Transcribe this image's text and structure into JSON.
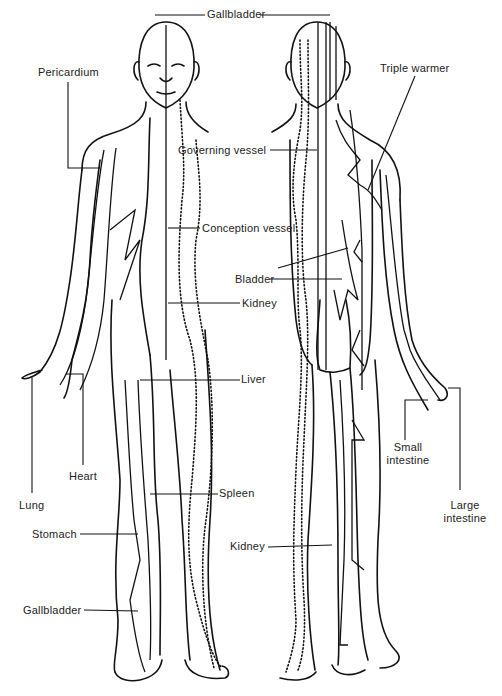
{
  "diagram": {
    "type": "anatomical meridian chart",
    "views": [
      "front",
      "back"
    ],
    "labels": [
      {
        "id": "gallbladder-head",
        "text": "Gallbladder",
        "x": 207,
        "y": 37
      },
      {
        "id": "pericardium",
        "text": "Pericardium",
        "x": 38,
        "y": 66
      },
      {
        "id": "triple-warmer",
        "text": "Triple warmer",
        "x": 380,
        "y": 62
      },
      {
        "id": "governing-vessel",
        "text": "Governing vessel",
        "x": 178,
        "y": 145
      },
      {
        "id": "conception-vessel",
        "text": "Conception vessel",
        "x": 202,
        "y": 222
      },
      {
        "id": "bladder",
        "text": "Bladder",
        "x": 235,
        "y": 273
      },
      {
        "id": "kidney-front",
        "text": "Kidney",
        "x": 242,
        "y": 297
      },
      {
        "id": "liver",
        "text": "Liver",
        "x": 241,
        "y": 373
      },
      {
        "id": "small-intestine",
        "text": "Small\nintestine",
        "x": 386,
        "y": 441
      },
      {
        "id": "heart",
        "text": "Heart",
        "x": 69,
        "y": 470
      },
      {
        "id": "large-intestine",
        "text": "Large\nintestine",
        "x": 442,
        "y": 499
      },
      {
        "id": "lung",
        "text": "Lung",
        "x": 19,
        "y": 499
      },
      {
        "id": "spleen",
        "text": "Spleen",
        "x": 219,
        "y": 487
      },
      {
        "id": "stomach",
        "text": "Stomach",
        "x": 32,
        "y": 528
      },
      {
        "id": "kidney-back",
        "text": "Kidney",
        "x": 230,
        "y": 540
      },
      {
        "id": "gallbladder-leg",
        "text": "Gallbladder",
        "x": 23,
        "y": 604
      }
    ]
  }
}
